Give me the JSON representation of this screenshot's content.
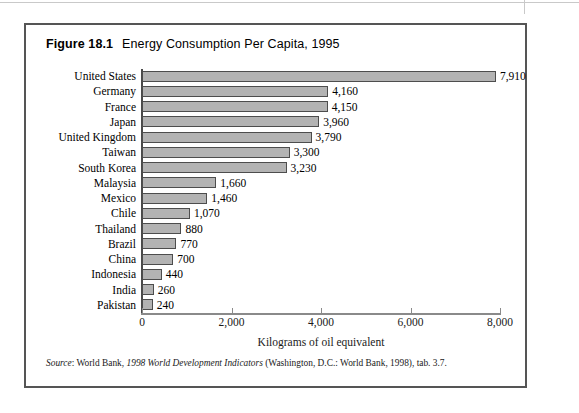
{
  "figure": {
    "number": "Figure 18.1",
    "title": "Energy Consumption Per Capita, 1995",
    "source": {
      "label": "Source",
      "colon": ": World Bank, ",
      "title_italic": "1998 World Development Indicators",
      "tail": " (Washington, D.C.: World Bank, 1998), tab. 3.7."
    }
  },
  "chart_data": {
    "type": "bar",
    "orientation": "horizontal",
    "title": "Energy Consumption Per Capita, 1995",
    "xlabel": "Kilograms of oil equivalent",
    "ylabel": "",
    "xlim": [
      0,
      8000
    ],
    "xticks": [
      0,
      2000,
      4000,
      6000,
      8000
    ],
    "xtick_labels": [
      "0",
      "2,000",
      "4,000",
      "6,000",
      "8,000"
    ],
    "grid": false,
    "legend": null,
    "bar_color": "#b3b3b3",
    "bar_edge_color": "#4d4d4d",
    "categories": [
      "United States",
      "Germany",
      "France",
      "Japan",
      "United Kingdom",
      "Taiwan",
      "South Korea",
      "Malaysia",
      "Mexico",
      "Chile",
      "Thailand",
      "Brazil",
      "China",
      "Indonesia",
      "India",
      "Pakistan"
    ],
    "values": [
      7910,
      4160,
      4150,
      3960,
      3790,
      3300,
      3230,
      1660,
      1460,
      1070,
      880,
      770,
      700,
      440,
      260,
      240
    ],
    "value_labels": [
      "7,910",
      "4,160",
      "4,150",
      "3,960",
      "3,790",
      "3,300",
      "3,230",
      "1,660",
      "1,460",
      "1,070",
      "880",
      "770",
      "700",
      "440",
      "260",
      "240"
    ]
  }
}
